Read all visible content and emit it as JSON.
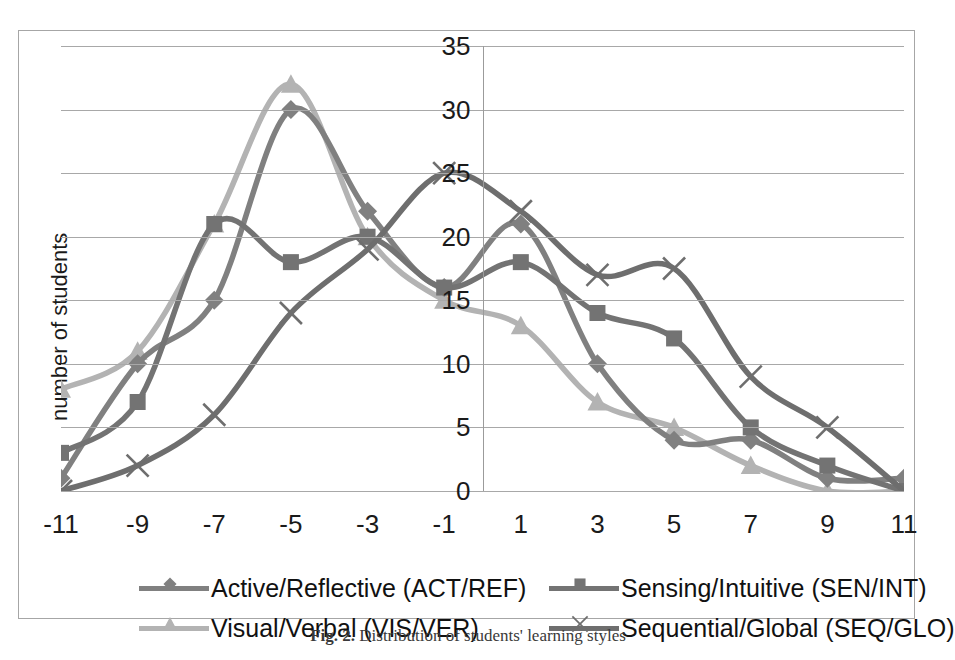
{
  "figure": {
    "caption_label": "Fig. 2.",
    "caption_text": "Distribution of students' learning styles"
  },
  "chart_data": {
    "type": "line",
    "title": "",
    "xlabel": "",
    "ylabel": "number of students",
    "xlim": [
      -11,
      11
    ],
    "ylim": [
      0,
      35
    ],
    "grid": true,
    "legend_position": "bottom",
    "x": [
      -11,
      -9,
      -7,
      -5,
      -3,
      -1,
      1,
      3,
      5,
      7,
      9,
      11
    ],
    "categories": [
      "-11",
      "-9",
      "-7",
      "-5",
      "-3",
      "-1",
      "1",
      "3",
      "5",
      "7",
      "9",
      "11"
    ],
    "ytick_labels": [
      "0",
      "5",
      "10",
      "15",
      "20",
      "25",
      "30",
      "35"
    ],
    "ytick_values": [
      0,
      5,
      10,
      15,
      20,
      25,
      30,
      35
    ],
    "series": [
      {
        "name": "Active/Reflective (ACT/REF)",
        "marker": "diamond",
        "color": "#808080",
        "values": [
          1,
          10,
          15,
          30,
          22,
          16,
          21,
          10,
          4,
          4,
          1,
          1
        ]
      },
      {
        "name": "Sensing/Intuitive (SEN/INT)",
        "marker": "square",
        "color": "#737373",
        "values": [
          3,
          7,
          21,
          18,
          20,
          16,
          18,
          14,
          12,
          5,
          2,
          0
        ]
      },
      {
        "name": "Visual/Verbal (VIS/VER)",
        "marker": "triangle",
        "color": "#b3b3b3",
        "values": [
          8,
          11,
          21,
          32,
          20,
          15,
          13,
          7,
          5,
          2,
          0,
          0
        ]
      },
      {
        "name": "Sequential/Global (SEQ/GLO)",
        "marker": "cross",
        "color": "#6e6e6e",
        "values": [
          0,
          2,
          6,
          14,
          19,
          25,
          22,
          17,
          17.5,
          9,
          5,
          0
        ]
      }
    ]
  },
  "legend": {
    "entries": [
      {
        "label": "Active/Reflective (ACT/REF)",
        "marker": "diamond",
        "color": "#808080"
      },
      {
        "label": "Sensing/Intuitive (SEN/INT)",
        "marker": "square",
        "color": "#737373"
      },
      {
        "label": "Visual/Verbal (VIS/VER)",
        "marker": "triangle",
        "color": "#b3b3b3"
      },
      {
        "label": "Sequential/Global (SEQ/GLO)",
        "marker": "cross",
        "color": "#6e6e6e"
      }
    ]
  }
}
